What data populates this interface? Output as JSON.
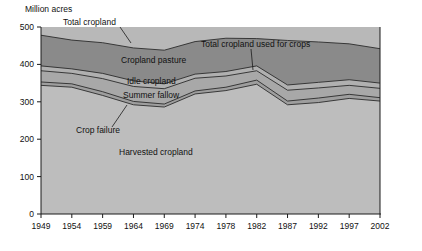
{
  "chart_data": {
    "type": "area",
    "title": "",
    "ylabel": "Million acres",
    "xlabel": "",
    "ylim": [
      0,
      500
    ],
    "yticks": [
      0,
      100,
      200,
      300,
      400,
      500
    ],
    "grid": false,
    "legend_position": "inline-annotations",
    "categories": [
      "1949",
      "1954",
      "1959",
      "1964",
      "1969",
      "1974",
      "1978",
      "1982",
      "1987",
      "1992",
      "1997",
      "2002"
    ],
    "x": [
      1949,
      1954,
      1959,
      1964,
      1969,
      1974,
      1978,
      1982,
      1987,
      1992,
      1997,
      2002
    ],
    "stacking": "cumulative-top-lines",
    "series": [
      {
        "name": "Harvested cropland",
        "order": 1,
        "values": [
          344,
          339,
          317,
          292,
          286,
          321,
          330,
          347,
          292,
          298,
          309,
          302
        ]
      },
      {
        "name": "Crop failure",
        "order": 2,
        "values": [
          353,
          348,
          327,
          301,
          294,
          329,
          339,
          358,
          302,
          310,
          320,
          311
        ]
      },
      {
        "name": "Summer fallow",
        "order": 3,
        "values": [
          383,
          376,
          362,
          341,
          335,
          363,
          369,
          383,
          331,
          337,
          344,
          336
        ]
      },
      {
        "name": "Idle cropland",
        "order": 4,
        "values": [
          396,
          388,
          376,
          356,
          348,
          374,
          381,
          396,
          345,
          352,
          359,
          350
        ]
      },
      {
        "name": "Total cropland",
        "order": 5,
        "values": [
          478,
          465,
          458,
          444,
          438,
          461,
          470,
          469,
          464,
          460,
          455,
          442
        ]
      }
    ],
    "annotations": [
      {
        "label": "Total cropland",
        "type": "series-callout",
        "target_series": "Total cropland"
      },
      {
        "label": "Total cropland used for crops",
        "type": "series-callout",
        "target_series": "Idle cropland"
      },
      {
        "label": "Cropland pasture",
        "type": "band-label"
      },
      {
        "label": "Idle cropland",
        "type": "band-label"
      },
      {
        "label": "Summer fallow",
        "type": "band-label"
      },
      {
        "label": "Crop failure",
        "type": "series-callout"
      },
      {
        "label": "Harvested cropland",
        "type": "band-label"
      }
    ],
    "colors": {
      "plot_background": "#b8b8b8",
      "band_total_cropland": "#8a8a8a",
      "band_idle_cropland": "#b0b0b0",
      "band_summer_fallow": "#a8a8a8",
      "band_crop_failure": "#9e9e9e",
      "band_harvested": "#bdbdbd",
      "axis": "#1a1a1a",
      "text": "#111111"
    }
  },
  "axis": {
    "y_title": "Million acres",
    "y_ticks": [
      "500",
      "400",
      "300",
      "200",
      "100",
      "0"
    ],
    "x_ticks": [
      "1949",
      "1954",
      "1959",
      "1964",
      "1969",
      "1974",
      "1978",
      "1982",
      "1987",
      "1992",
      "1997",
      "2002"
    ]
  },
  "labels": {
    "total_cropland": "Total cropland",
    "total_cropland_used_for_crops": "Total cropland used for crops",
    "cropland_pasture": "Cropland pasture",
    "idle_cropland": "Idle cropland",
    "summer_fallow": "Summer fallow",
    "crop_failure": "Crop failure",
    "harvested_cropland": "Harvested cropland"
  }
}
